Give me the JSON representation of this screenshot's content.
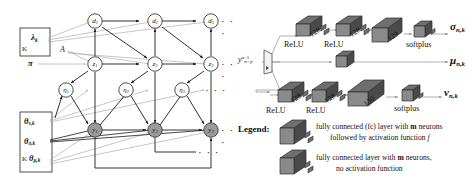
{
  "figure": {
    "caption": "",
    "panels": [
      "graphical-model",
      "neural-network"
    ]
  },
  "colors": {
    "node_fill": "#ffffff",
    "node_observed_fill": "#9a9a9a",
    "node_stroke": "#3a3a3a",
    "edge_dark": "#1b1b1b",
    "edge_light": "#a9a9a9",
    "block_top": "#6e6e6e",
    "block_side": "#4a4a4a",
    "block_face": "#8a8a8a",
    "plate_stroke": "#3a3a3a",
    "text": "#1b1b1b"
  },
  "left_panel": {
    "name": "probabilistic-graphical-model",
    "plates": [
      {
        "id": "plate-lambda",
        "index_label": "K"
      },
      {
        "id": "plate-theta",
        "index_label": "K"
      }
    ],
    "plate_params": {
      "lambda": {
        "symbol": "λ",
        "subscript": "k"
      },
      "theta_nu": {
        "symbol": "θ",
        "subscript": "ν,k"
      },
      "theta_sigma": {
        "symbol": "θ",
        "subscript": "σ,k"
      },
      "theta_mu": {
        "symbol": "θ",
        "subscript": "μ,k"
      }
    },
    "free_params": [
      {
        "id": "A",
        "symbol": "A"
      },
      {
        "id": "pi",
        "symbol": "π"
      }
    ],
    "rows": [
      {
        "id": "row-d",
        "nodes": [
          {
            "symbol": "d",
            "subscript": "1"
          },
          {
            "symbol": "d",
            "subscript": "2"
          },
          {
            "symbol": "d",
            "subscript": "3"
          }
        ],
        "ellipsis": "· · ·",
        "observed": false
      },
      {
        "id": "row-z",
        "nodes": [
          {
            "symbol": "z",
            "subscript": "1"
          },
          {
            "symbol": "z",
            "subscript": "2"
          },
          {
            "symbol": "z",
            "subscript": "3"
          }
        ],
        "ellipsis": "· · ·",
        "observed": false
      },
      {
        "id": "row-eta",
        "nodes": [
          {
            "symbol": "η",
            "subscript": "1"
          },
          {
            "symbol": "η",
            "subscript": "2"
          },
          {
            "symbol": "η",
            "subscript": "3"
          }
        ],
        "ellipsis": "· · ·",
        "observed": false
      },
      {
        "id": "row-y",
        "nodes": [
          {
            "symbol": "y",
            "subscript": "1"
          },
          {
            "symbol": "y",
            "subscript": "2"
          },
          {
            "symbol": "y",
            "subscript": "3"
          }
        ],
        "ellipsis": "· · ·",
        "observed": true
      }
    ],
    "feedback_ellipsis": "· · ·"
  },
  "right_panel": {
    "name": "neural-network-architecture",
    "input": {
      "symbol": "y",
      "subscript": "n−p",
      "superscript": "n−1"
    },
    "branches": [
      {
        "id": "branch-sigma",
        "layers": [
          {
            "neurons": "128",
            "activation": "ReLU",
            "type": "fc-activation"
          },
          {
            "neurons": "128",
            "activation": "ReLU",
            "type": "fc-activation"
          },
          {
            "neurons": "129",
            "activation": "",
            "type": "fc-plain"
          },
          {
            "neurons": "",
            "activation": "softplus",
            "type": "fc-activation"
          }
        ],
        "output": {
          "symbol": "σ",
          "subscript": "n,k"
        }
      },
      {
        "id": "branch-mu",
        "layers": [
          {
            "neurons": "",
            "activation": "",
            "type": "fc-plain"
          }
        ],
        "output": {
          "symbol": "μ",
          "subscript": "n,k"
        }
      },
      {
        "id": "branch-nu",
        "layers": [
          {
            "neurons": "128",
            "activation": "ReLU",
            "type": "fc-activation"
          },
          {
            "neurons": "128",
            "activation": "ReLU",
            "type": "fc-activation"
          },
          {
            "neurons": "130",
            "activation": "",
            "type": "fc-plain"
          },
          {
            "neurons": "",
            "activation": "softplus",
            "type": "fc-activation"
          }
        ],
        "output": {
          "symbol": "ν",
          "subscript": "n,k"
        }
      }
    ],
    "legend": {
      "title": "Legend:",
      "entries": [
        {
          "id": "legend-fc-activation",
          "line1_pre": "fully connected (fc) layer with ",
          "line1_bold": "m",
          "line1_post": " neurons",
          "line2_pre": "followed by activation function ",
          "line2_italic": "f",
          "line2_post": ""
        },
        {
          "id": "legend-fc-plain",
          "line1_pre": "fully connected layer with ",
          "line1_bold": "m",
          "line1_post": " neurons,",
          "line2_pre": "no activation function",
          "line2_italic": "",
          "line2_post": ""
        }
      ]
    }
  }
}
